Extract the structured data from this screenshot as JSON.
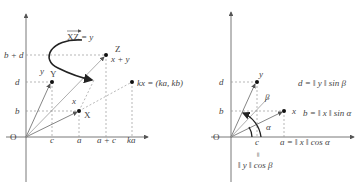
{
  "left_figure": {
    "origin_label": "O",
    "x_ticks": [
      "c",
      "a",
      "a + c",
      "ka"
    ],
    "y_ticks": [
      "b + d",
      "d",
      "b"
    ],
    "points": {
      "X": {
        "label": "X",
        "vector": "x"
      },
      "Y": {
        "label": "Y",
        "vector": "y"
      },
      "Z": {
        "label": "Z",
        "vector": "x + y"
      },
      "kx": {
        "label": "kx = (ka, kb)"
      }
    },
    "arrow_annotation": "XZ = y",
    "arrow_annotation_vec": "XZ",
    "arrow_annotation_rhs": "= y"
  },
  "right_figure": {
    "origin_label": "O",
    "x_ticks": [
      "c",
      "a = ‖ x ‖ cos α"
    ],
    "y_ticks": [
      "d",
      "b"
    ],
    "vectors": [
      "y",
      "x"
    ],
    "angles": [
      "β",
      "α"
    ],
    "equations": {
      "d": "d = ‖ y ‖ sin β",
      "b": "b = ‖ x ‖ sin α",
      "c_eq_sign": "=",
      "c": "‖ y ‖ cos β"
    }
  },
  "colors": {
    "axis": "#555555",
    "dashed": "#9a9a9a",
    "curve": "#222222",
    "text": "#444444"
  }
}
